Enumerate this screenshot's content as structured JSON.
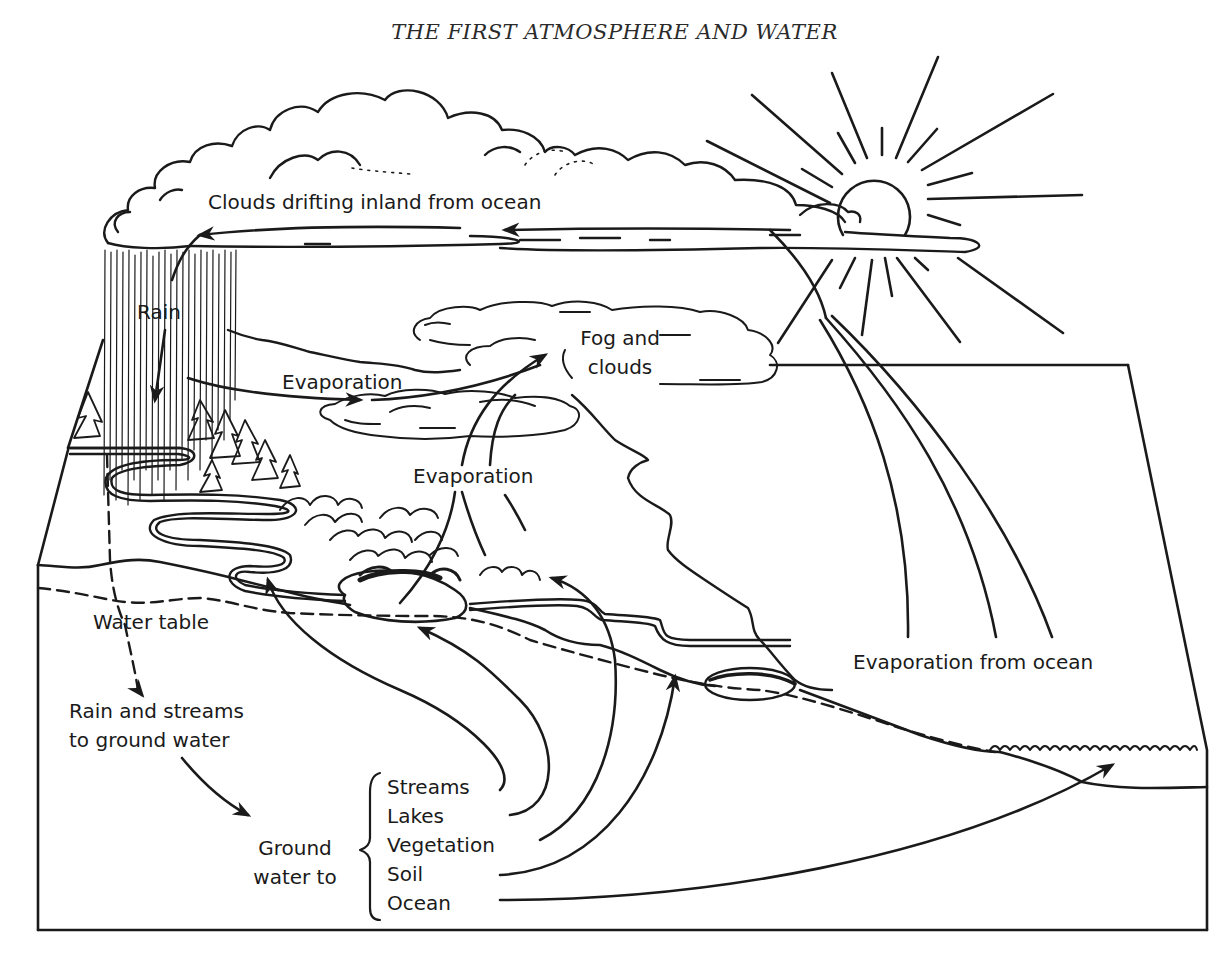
{
  "page": {
    "title": "THE FIRST ATMOSPHERE AND WATER"
  },
  "colors": {
    "ink": "#1a1a1a",
    "paper": "#ffffff"
  },
  "labels": {
    "clouds_drifting": "Clouds drifting inland from ocean",
    "rain": "Rain",
    "evaporation_land": "Evaporation",
    "fog_line1": "Fog and",
    "fog_line2": "clouds",
    "evaporation_lake": "Evaporation",
    "water_table": "Water table",
    "rain_streams_line1": "Rain and streams",
    "rain_streams_line2": "to ground water",
    "ground_water_line1": "Ground",
    "ground_water_line2": "water to",
    "evaporation_ocean": "Evaporation from ocean"
  },
  "ground_water_destinations": [
    "Streams",
    "Lakes",
    "Vegetation",
    "Soil",
    "Ocean"
  ],
  "icons": {
    "sun": "sun-icon",
    "clouds": "cloud-icon",
    "rain": "rain-icon",
    "trees": "tree-icon",
    "ocean_waves": "wave-icon"
  }
}
